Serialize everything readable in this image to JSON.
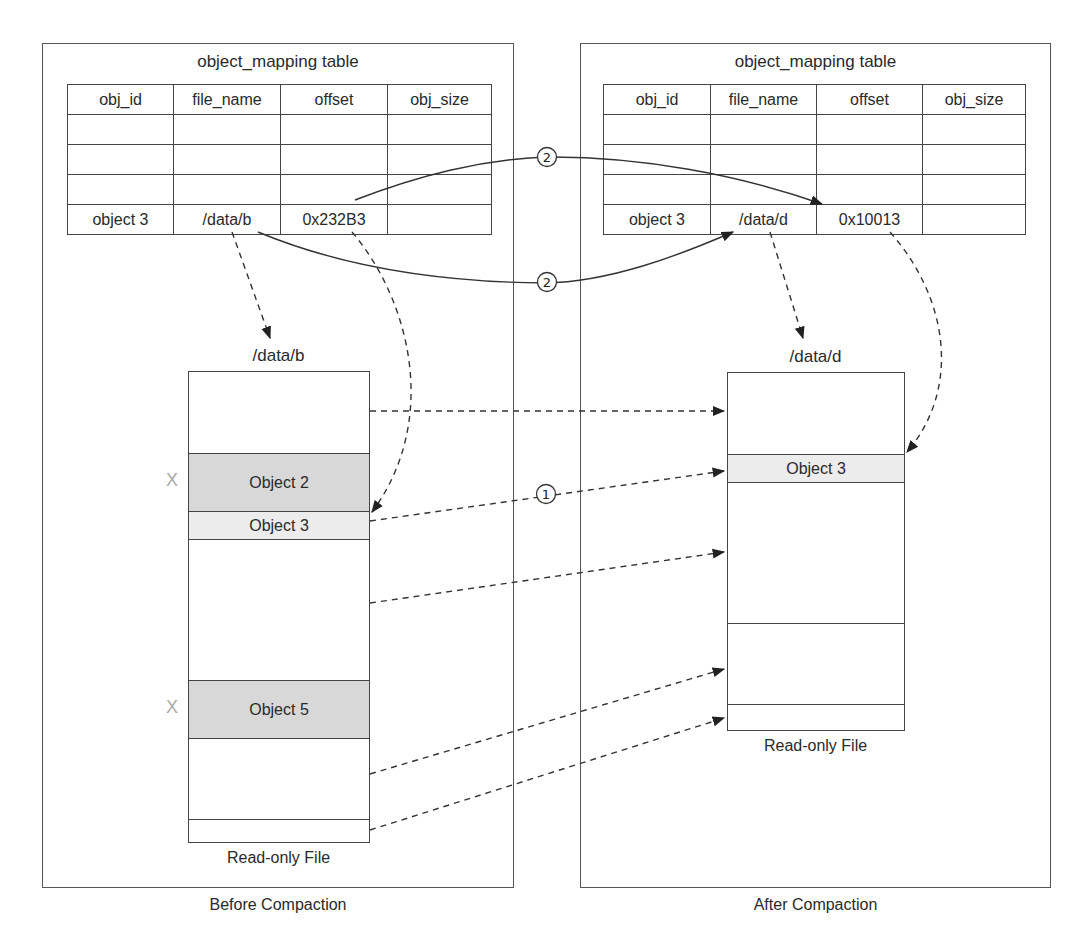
{
  "before": {
    "caption": "Before Compaction",
    "table": {
      "title": "object_mapping table",
      "headers": [
        "obj_id",
        "file_name",
        "offset",
        "obj_size"
      ],
      "rows": [
        [
          "",
          "",
          "",
          ""
        ],
        [
          "",
          "",
          "",
          ""
        ],
        [
          "",
          "",
          "",
          ""
        ],
        [
          "object 3",
          "/data/b",
          "0x232B3",
          ""
        ]
      ]
    },
    "file": {
      "name": "/data/b",
      "footer": "Read-only File",
      "segments": [
        {
          "label": "",
          "style": "empty"
        },
        {
          "label": "Object 2",
          "style": "dark",
          "deleted_mark": "X"
        },
        {
          "label": "Object 3",
          "style": "light"
        },
        {
          "label": "",
          "style": "empty"
        },
        {
          "label": "Object 5",
          "style": "dark",
          "deleted_mark": "X"
        },
        {
          "label": "",
          "style": "empty"
        },
        {
          "label": "",
          "style": "empty"
        }
      ]
    }
  },
  "after": {
    "caption": "After Compaction",
    "table": {
      "title": "object_mapping table",
      "headers": [
        "obj_id",
        "file_name",
        "offset",
        "obj_size"
      ],
      "rows": [
        [
          "",
          "",
          "",
          ""
        ],
        [
          "",
          "",
          "",
          ""
        ],
        [
          "",
          "",
          "",
          ""
        ],
        [
          "object 3",
          "/data/d",
          "0x10013",
          ""
        ]
      ]
    },
    "file": {
      "name": "/data/d",
      "footer": "Read-only File",
      "segments": [
        {
          "label": "",
          "style": "empty"
        },
        {
          "label": "Object 3",
          "style": "light"
        },
        {
          "label": "",
          "style": "empty"
        },
        {
          "label": "",
          "style": "empty"
        },
        {
          "label": "",
          "style": "empty"
        }
      ]
    }
  },
  "step_markers": {
    "copy_step": "①",
    "update_step": "②"
  },
  "colors": {
    "line": "#333333",
    "deleted_fill": "#d8d8d8",
    "live_fill": "#ececec",
    "x_mark": "#aaaaaa"
  }
}
